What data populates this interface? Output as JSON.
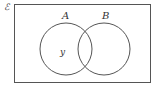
{
  "diagram": {
    "type": "venn",
    "universal_set_symbol": "ℰ",
    "sets": [
      {
        "label": "A"
      },
      {
        "label": "B"
      }
    ],
    "region_labels": [
      {
        "region": "A only",
        "text": "y"
      }
    ],
    "colors": {
      "stroke": "#555555",
      "background": "#ffffff"
    }
  }
}
